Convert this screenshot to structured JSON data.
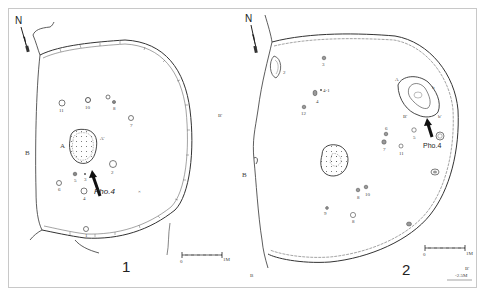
{
  "figures": [
    {
      "id": "1",
      "number_label": "1",
      "north_label": "N",
      "photo_label": "Pho.4",
      "section_labels": {
        "b_left": "B",
        "b_right": "B'",
        "a_left": "A",
        "a_right": "A'"
      },
      "postholes": [
        {
          "label": "1",
          "x": 87,
          "y": 228
        },
        {
          "label": "2",
          "x": 113,
          "y": 164
        },
        {
          "label": "3",
          "x": 75,
          "y": 175
        },
        {
          "label": "4",
          "x": 84,
          "y": 191
        },
        {
          "label": "5",
          "x": 58,
          "y": 182
        },
        {
          "label": "6",
          "x": 60,
          "y": 183
        },
        {
          "label": "7",
          "x": 131,
          "y": 118
        },
        {
          "label": "8",
          "x": 115,
          "y": 103
        },
        {
          "label": "9",
          "x": 108,
          "y": 98
        },
        {
          "label": "10",
          "x": 88,
          "y": 100
        },
        {
          "label": "11",
          "x": 62,
          "y": 103
        }
      ],
      "scale": {
        "start": "0",
        "end": "1M"
      }
    },
    {
      "id": "2",
      "number_label": "2",
      "north_label": "N",
      "photo_label": "Pho.4",
      "section_labels": {
        "b_left": "B",
        "b_right": "B'",
        "b_bottom": "B",
        "a_label": "A",
        "a2_label": "A'",
        "b2_label": "B'",
        "b3_label": "b",
        "b4_label": "b'"
      },
      "postholes": [
        {
          "label": "1",
          "x": 440,
          "y": 136
        },
        {
          "label": "2",
          "x": 270,
          "y": 72
        },
        {
          "label": "3",
          "x": 324,
          "y": 58
        },
        {
          "label": "4",
          "x": 316,
          "y": 92
        },
        {
          "label": "4-1",
          "x": 321,
          "y": 91
        },
        {
          "label": "5",
          "x": 414,
          "y": 132
        },
        {
          "label": "6",
          "x": 386,
          "y": 135
        },
        {
          "label": "7",
          "x": 385,
          "y": 145
        },
        {
          "label": "8",
          "x": 358,
          "y": 189
        },
        {
          "label": "9",
          "x": 353,
          "y": 215
        },
        {
          "label": "10",
          "x": 327,
          "y": 209
        },
        {
          "label": "11",
          "x": 366,
          "y": 187
        },
        {
          "label": "12",
          "x": 401,
          "y": 147
        },
        {
          "label": "13",
          "x": 304,
          "y": 107
        }
      ],
      "scale": {
        "start": "0",
        "end": "1M"
      },
      "elevation_note": {
        "label": "B'",
        "value": "-2.5M"
      }
    }
  ]
}
